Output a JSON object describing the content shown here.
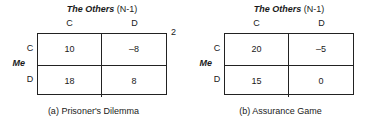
{
  "figure": {
    "panels": [
      {
        "id": "prisoners-dilemma",
        "col_title_strong": "The Others",
        "col_title_plain": " (N-1)",
        "col_headers": [
          "C",
          "D"
        ],
        "row_group_label": "Me",
        "row_headers": [
          "C",
          "D"
        ],
        "cells": [
          [
            "10",
            "–8"
          ],
          [
            "18",
            "8"
          ]
        ],
        "corner_marker": "2",
        "caption": "(a) Prisoner's Dilemma"
      },
      {
        "id": "assurance-game",
        "col_title_strong": "The Others",
        "col_title_plain": " (N-1)",
        "col_headers": [
          "C",
          "D"
        ],
        "row_group_label": "Me",
        "row_headers": [
          "C",
          "D"
        ],
        "cells": [
          [
            "20",
            "–5"
          ],
          [
            "15",
            "0"
          ]
        ],
        "corner_marker": "",
        "caption": "(b) Assurance Game"
      }
    ]
  },
  "chart_data": {
    "type": "table",
    "tables": [
      {
        "name": "(a) Prisoner's Dilemma",
        "row_label": "Me",
        "col_label": "The Others (N-1)",
        "row_categories": [
          "C",
          "D"
        ],
        "col_categories": [
          "C",
          "D"
        ],
        "values": [
          [
            10,
            -8
          ],
          [
            18,
            8
          ]
        ],
        "annotation": "2"
      },
      {
        "name": "(b) Assurance Game",
        "row_label": "Me",
        "col_label": "The Others (N-1)",
        "row_categories": [
          "C",
          "D"
        ],
        "col_categories": [
          "C",
          "D"
        ],
        "values": [
          [
            20,
            -5
          ],
          [
            15,
            0
          ]
        ],
        "annotation": ""
      }
    ]
  }
}
